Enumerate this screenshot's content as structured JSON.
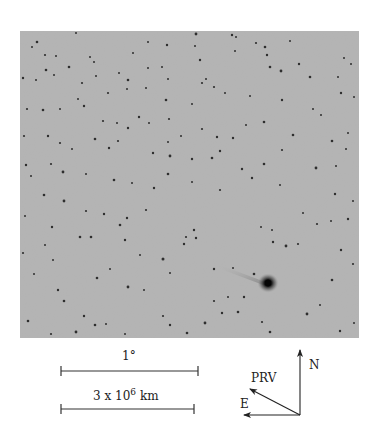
{
  "figure": {
    "type": "astronomical-photograph",
    "background_color": "#b3b3b3",
    "star_color": "#2a2a2a"
  },
  "scale_bars": {
    "angular": {
      "label": "1°"
    },
    "distance": {
      "label_base": "3 x 10",
      "label_exponent": "6",
      "label_unit": "km"
    }
  },
  "compass": {
    "north_label": "N",
    "east_label": "E",
    "prv_label": "PRV"
  }
}
